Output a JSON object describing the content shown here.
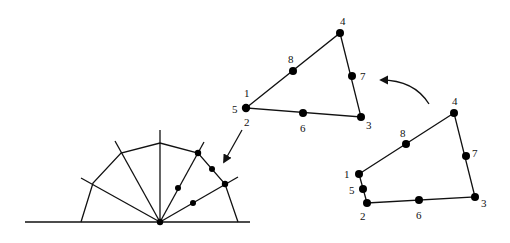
{
  "diagram": {
    "type": "finite-element-degenerate-mapping",
    "half_disk": {
      "center": [
        160,
        222
      ],
      "baseline": [
        [
          25,
          222
        ],
        [
          250,
          222
        ]
      ],
      "arc_polygon": [
        [
          81,
          222
        ],
        [
          93,
          183
        ],
        [
          121,
          153
        ],
        [
          160,
          143
        ],
        [
          198,
          153
        ],
        [
          225,
          184
        ],
        [
          238,
          222
        ]
      ],
      "rays": [
        [
          81,
          178
        ],
        [
          115,
          141
        ],
        [
          160,
          130
        ],
        [
          204,
          142
        ],
        [
          238,
          177
        ]
      ],
      "nodes": [
        [
          160,
          222
        ],
        [
          198,
          153
        ],
        [
          212,
          169
        ],
        [
          225,
          184
        ],
        [
          178,
          188
        ],
        [
          193,
          203
        ]
      ]
    },
    "triangle_element": {
      "edges": [
        [
          "5",
          "4"
        ],
        [
          "4",
          "3"
        ],
        [
          "3",
          "5"
        ]
      ],
      "nodes": [
        {
          "id": "1",
          "x": 246,
          "y": 108,
          "label_pos": [
            244,
            97
          ]
        },
        {
          "id": "5",
          "x": 246,
          "y": 108,
          "label_pos": [
            233,
            112
          ]
        },
        {
          "id": "2",
          "x": 246,
          "y": 108,
          "label_pos": [
            245,
            124
          ]
        },
        {
          "id": "8",
          "x": 293,
          "y": 71,
          "label_pos": [
            288,
            61
          ]
        },
        {
          "id": "4",
          "x": 340,
          "y": 33,
          "label_pos": [
            337,
            23
          ]
        },
        {
          "id": "7",
          "x": 352,
          "y": 76,
          "label_pos": [
            360,
            78
          ]
        },
        {
          "id": "3",
          "x": 361,
          "y": 117,
          "label_pos": [
            367,
            127
          ]
        },
        {
          "id": "6",
          "x": 303,
          "y": 113,
          "label_pos": [
            301,
            130
          ]
        }
      ]
    },
    "quad_element": {
      "outline": [
        [
          359,
          174
        ],
        [
          367,
          203
        ],
        [
          475,
          197
        ],
        [
          454,
          113
        ]
      ],
      "nodes": [
        {
          "id": "1",
          "x": 359,
          "y": 174,
          "label_pos": [
            344,
            176
          ]
        },
        {
          "id": "5",
          "x": 363,
          "y": 189,
          "label_pos": [
            350,
            192
          ]
        },
        {
          "id": "2",
          "x": 367,
          "y": 203,
          "label_pos": [
            360,
            218
          ]
        },
        {
          "id": "6",
          "x": 419,
          "y": 200,
          "label_pos": [
            416,
            219
          ]
        },
        {
          "id": "3",
          "x": 475,
          "y": 197,
          "label_pos": [
            482,
            206
          ]
        },
        {
          "id": "7",
          "x": 466,
          "y": 156,
          "label_pos": [
            472,
            155
          ]
        },
        {
          "id": "4",
          "x": 454,
          "y": 113,
          "label_pos": [
            452,
            103
          ]
        },
        {
          "id": "8",
          "x": 406,
          "y": 144,
          "label_pos": [
            400,
            135
          ]
        }
      ]
    },
    "arrows": [
      {
        "name": "quad-to-triangle-arrow",
        "from": [
          428,
          103
        ],
        "to": [
          381,
          80
        ],
        "curved": true
      },
      {
        "name": "triangle-to-halfdisk-arrow",
        "from": [
          242,
          130
        ],
        "to": [
          223,
          163
        ],
        "curved": false
      }
    ],
    "colors": {
      "stroke": "#111111",
      "node": "#000000",
      "background": "#ffffff"
    }
  }
}
